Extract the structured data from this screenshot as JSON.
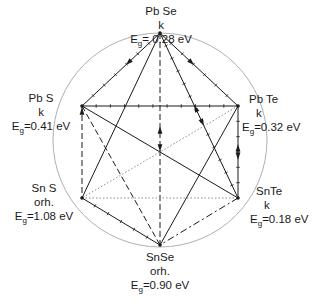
{
  "colors": {
    "line": "#1a1a1a",
    "circle": "#b0b0b0",
    "dotted": "#8a8a8a",
    "text": "#1a1a1a"
  },
  "circle": {
    "cx": 160,
    "cy": 140,
    "r": 107
  },
  "nodes": [
    {
      "id": "PbSe",
      "name": "Pb Se",
      "structure": "k",
      "eg_label": "E",
      "eg_sub": "g",
      "eg_value": "= 0.28  eV",
      "x": 160,
      "y": 33
    },
    {
      "id": "PbS",
      "name": "Pb S",
      "structure": "k",
      "eg_label": "E",
      "eg_sub": "g",
      "eg_value": "=0.41 eV",
      "x": 82,
      "y": 106
    },
    {
      "id": "PbTe",
      "name": "Pb Te",
      "structure": "k",
      "eg_label": "E",
      "eg_sub": "g",
      "eg_value": "=0.32  eV",
      "x": 238,
      "y": 106
    },
    {
      "id": "SnS",
      "name": "Sn S",
      "structure": "orh.",
      "eg_label": "E",
      "eg_sub": "g",
      "eg_value": "=1.08  eV",
      "x": 82,
      "y": 198
    },
    {
      "id": "SnTe",
      "name": "SnTe",
      "structure": "k",
      "eg_label": "E",
      "eg_sub": "g",
      "eg_value": "=0.18 eV",
      "x": 238,
      "y": 198
    },
    {
      "id": "SnSe",
      "name": "SnSe",
      "structure": "orh.",
      "eg_label": "E",
      "eg_sub": "g",
      "eg_value": "=0.90  eV",
      "x": 160,
      "y": 245
    }
  ],
  "edges": [
    {
      "from": "PbSe",
      "to": "PbS",
      "style": "solid-ticked",
      "arrow": "mid"
    },
    {
      "from": "PbSe",
      "to": "PbTe",
      "style": "solid-ticked",
      "arrow": "mid"
    },
    {
      "from": "PbSe",
      "to": "SnSe",
      "style": "dashed",
      "arrow": "double-mid"
    },
    {
      "from": "PbSe",
      "to": "SnS",
      "style": "solid",
      "arrow": "none"
    },
    {
      "from": "PbSe",
      "to": "SnTe",
      "style": "solid-ticked",
      "arrow": "double-mid"
    },
    {
      "from": "PbS",
      "to": "PbTe",
      "style": "solid-ticked",
      "arrow": "none"
    },
    {
      "from": "PbS",
      "to": "SnS",
      "style": "dashed",
      "arrow": "start"
    },
    {
      "from": "PbS",
      "to": "SnSe",
      "style": "dashed",
      "arrow": "none"
    },
    {
      "from": "PbS",
      "to": "SnTe",
      "style": "solid",
      "arrow": "none"
    },
    {
      "from": "PbTe",
      "to": "SnTe",
      "style": "solid-ticked",
      "arrow": "double-mid"
    },
    {
      "from": "PbTe",
      "to": "SnSe",
      "style": "solid",
      "arrow": "none"
    },
    {
      "from": "PbTe",
      "to": "SnS",
      "style": "dotted",
      "arrow": "none"
    },
    {
      "from": "SnS",
      "to": "SnTe",
      "style": "dotted",
      "arrow": "none"
    },
    {
      "from": "SnS",
      "to": "SnSe",
      "style": "solid-ticked",
      "arrow": "none"
    },
    {
      "from": "SnTe",
      "to": "SnSe",
      "style": "dash-dot",
      "arrow": "none"
    }
  ]
}
